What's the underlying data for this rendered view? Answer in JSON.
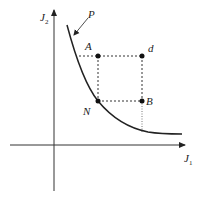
{
  "diagram": {
    "axes": {
      "x_label": "J",
      "x_sub": "1",
      "y_label": "J",
      "y_sub": "2"
    },
    "curve_label": "P",
    "points": [
      {
        "id": "A",
        "label": "A"
      },
      {
        "id": "d",
        "label": "d"
      },
      {
        "id": "N",
        "label": "N"
      },
      {
        "id": "B",
        "label": "B"
      }
    ],
    "colors": {
      "line": "#222222",
      "dotted": "#333333"
    }
  }
}
